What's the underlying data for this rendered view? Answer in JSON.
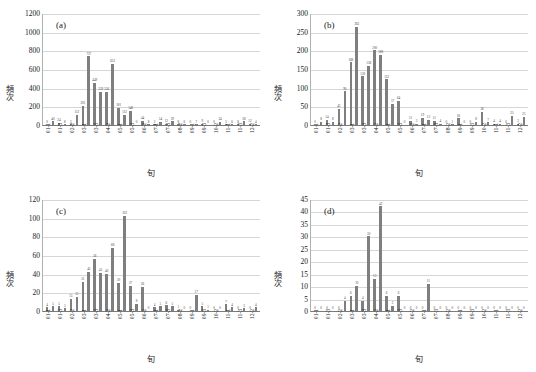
{
  "figure": {
    "axis_x_title": "旬",
    "axis_y_title": "頻次",
    "bar_color": "#7f7f7f",
    "gridline_color": "#d6d6d6",
    "categories": [
      "01-1",
      "01-2",
      "01-3",
      "02-1",
      "02-2",
      "02-3",
      "03-1",
      "03-2",
      "03-3",
      "04-1",
      "04-2",
      "04-3",
      "05-1",
      "05-2",
      "05-3",
      "06-1",
      "06-2",
      "06-3",
      "07-1",
      "07-2",
      "07-3",
      "08-1",
      "08-2",
      "08-3",
      "09-1",
      "09-2",
      "09-3",
      "10-1",
      "10-2",
      "10-3",
      "11-1",
      "11-2",
      "11-3",
      "12-1",
      "12-2",
      "12-3"
    ],
    "visible_tick_labels": [
      "01-1",
      "01-3",
      "02-2",
      "03-1",
      "03-3",
      "04-2",
      "05-1",
      "05-3",
      "06-2",
      "07-1",
      "07-3",
      "08-2",
      "09-1",
      "09-3",
      "10-2",
      "11-1",
      "11-3",
      "12-2"
    ]
  },
  "chart_data": [
    {
      "type": "bar",
      "title": "(a)",
      "xlabel": "旬",
      "ylabel": "頻次",
      "ylim": [
        0,
        1200
      ],
      "ytick_step": 200,
      "yticks": [
        0,
        200,
        400,
        600,
        800,
        1000,
        1200
      ],
      "grid": true,
      "legend": "none",
      "categories": [
        "01-1",
        "01-2",
        "01-3",
        "02-1",
        "02-2",
        "02-3",
        "03-1",
        "03-2",
        "03-3",
        "04-1",
        "04-2",
        "04-3",
        "05-1",
        "05-2",
        "05-3",
        "06-1",
        "06-2",
        "06-3",
        "07-1",
        "07-2",
        "07-3",
        "08-1",
        "08-2",
        "08-3",
        "09-1",
        "09-2",
        "09-3",
        "10-1",
        "10-2",
        "10-3",
        "11-1",
        "11-2",
        "11-3",
        "12-1",
        "12-2",
        "12-3"
      ],
      "values": [
        0,
        40,
        24,
        8,
        3,
        112,
        203,
        737,
        449,
        359,
        356,
        652,
        181,
        112,
        148,
        0,
        44,
        8,
        2,
        34,
        12,
        39,
        8,
        6,
        0,
        7,
        9,
        0,
        0,
        34,
        5,
        6,
        8,
        38,
        12,
        4
      ]
    },
    {
      "type": "bar",
      "title": "(b)",
      "xlabel": "旬",
      "ylabel": "頻次",
      "ylim": [
        0,
        300
      ],
      "ytick_step": 50,
      "yticks": [
        0,
        50,
        100,
        150,
        200,
        250,
        300
      ],
      "grid": true,
      "legend": "none",
      "categories": [
        "01-1",
        "01-2",
        "01-3",
        "02-1",
        "02-2",
        "02-3",
        "03-1",
        "03-2",
        "03-3",
        "04-1",
        "04-2",
        "04-3",
        "05-1",
        "05-2",
        "05-3",
        "06-1",
        "06-2",
        "06-3",
        "07-1",
        "07-2",
        "07-3",
        "08-1",
        "08-2",
        "08-3",
        "09-1",
        "09-2",
        "09-3",
        "10-1",
        "10-2",
        "10-3",
        "11-1",
        "11-2",
        "11-3",
        "12-1",
        "12-2",
        "12-3"
      ],
      "values": [
        0,
        8,
        14,
        8,
        43,
        90,
        168,
        263,
        130,
        158,
        200,
        188,
        122,
        57,
        64,
        0,
        11,
        3,
        19,
        13,
        11,
        4,
        0,
        1,
        18,
        0,
        0,
        8,
        36,
        7,
        4,
        4,
        0,
        25,
        3,
        21
      ]
    },
    {
      "type": "bar",
      "title": "(c)",
      "xlabel": "旬",
      "ylabel": "頻次",
      "ylim": [
        0,
        120
      ],
      "ytick_step": 20,
      "yticks": [
        0,
        20,
        40,
        60,
        80,
        100,
        120
      ],
      "grid": true,
      "legend": "none",
      "categories": [
        "01-1",
        "01-2",
        "01-3",
        "02-1",
        "02-2",
        "02-3",
        "03-1",
        "03-2",
        "03-3",
        "04-1",
        "04-2",
        "04-3",
        "05-1",
        "05-2",
        "05-3",
        "06-1",
        "06-2",
        "06-3",
        "07-1",
        "07-2",
        "07-3",
        "08-1",
        "08-2",
        "08-3",
        "09-1",
        "09-2",
        "09-3",
        "10-1",
        "10-2",
        "10-3",
        "11-1",
        "11-2",
        "11-3",
        "12-1",
        "12-2",
        "12-3"
      ],
      "values": [
        4,
        5,
        5,
        3,
        13,
        15,
        31,
        42,
        56,
        41,
        40,
        68,
        30,
        102,
        27,
        8,
        26,
        0,
        4,
        5,
        6,
        5,
        1,
        0,
        0,
        17,
        5,
        1,
        0,
        0,
        7,
        4,
        0,
        3,
        0,
        4
      ]
    },
    {
      "type": "bar",
      "title": "(d)",
      "xlabel": "旬",
      "ylabel": "頻次",
      "ylim": [
        0,
        45
      ],
      "ytick_step": 5,
      "yticks": [
        0,
        5,
        10,
        15,
        20,
        25,
        30,
        35,
        40,
        45
      ],
      "grid": true,
      "legend": "none",
      "categories": [
        "01-1",
        "01-2",
        "01-3",
        "02-1",
        "02-2",
        "02-3",
        "03-1",
        "03-2",
        "03-3",
        "04-1",
        "04-2",
        "04-3",
        "05-1",
        "05-2",
        "05-3",
        "06-1",
        "06-2",
        "06-3",
        "07-1",
        "07-2",
        "07-3",
        "08-1",
        "08-2",
        "08-3",
        "09-1",
        "09-2",
        "09-3",
        "10-1",
        "10-2",
        "10-3",
        "11-1",
        "11-2",
        "11-3",
        "12-1",
        "12-2",
        "12-3"
      ],
      "values": [
        0,
        0,
        0,
        0,
        0,
        4,
        6,
        10,
        4,
        30,
        13,
        42,
        6,
        2,
        6,
        0,
        0,
        0,
        0,
        11,
        0,
        0,
        0,
        0,
        0,
        0,
        0,
        0,
        0,
        0,
        0,
        0,
        0,
        0,
        0,
        0
      ]
    }
  ]
}
